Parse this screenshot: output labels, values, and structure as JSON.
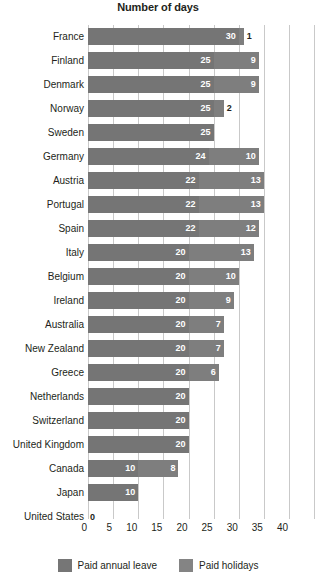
{
  "chart_data": {
    "type": "bar",
    "orientation": "horizontal",
    "stacked": true,
    "title": "Number of days",
    "xlabel": "",
    "ylabel": "",
    "xlim": [
      0,
      40
    ],
    "xticks": [
      0,
      5,
      10,
      15,
      20,
      25,
      30,
      35,
      40
    ],
    "grid": true,
    "legend_position": "bottom",
    "categories": [
      "France",
      "Finland",
      "Denmark",
      "Norway",
      "Sweden",
      "Germany",
      "Austria",
      "Portugal",
      "Spain",
      "Italy",
      "Belgium",
      "Ireland",
      "Australia",
      "New Zealand",
      "Greece",
      "Netherlands",
      "Switzerland",
      "United Kingdom",
      "Canada",
      "Japan",
      "United States"
    ],
    "series": [
      {
        "name": "Paid annual leave",
        "color": "#757575",
        "values": [
          30,
          25,
          25,
          25,
          25,
          24,
          22,
          22,
          22,
          20,
          20,
          20,
          20,
          20,
          20,
          20,
          20,
          20,
          10,
          10,
          0
        ]
      },
      {
        "name": "Paid holidays",
        "color": "#7e7e7e",
        "values": [
          1,
          9,
          9,
          2,
          0,
          10,
          13,
          13,
          12,
          13,
          10,
          9,
          7,
          7,
          6,
          0,
          0,
          0,
          8,
          0,
          0
        ]
      }
    ],
    "totals": [
      31,
      34,
      34,
      27,
      25,
      34,
      35,
      35,
      34,
      33,
      30,
      29,
      27,
      27,
      26,
      20,
      20,
      20,
      18,
      10,
      0
    ]
  },
  "legend": {
    "items": [
      {
        "label": "Paid annual leave",
        "swatch": "annual"
      },
      {
        "label": "Paid holidays",
        "swatch": "holiday"
      }
    ]
  }
}
